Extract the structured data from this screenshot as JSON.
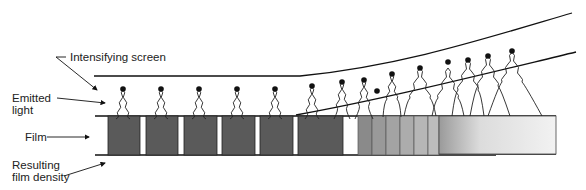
{
  "labels": {
    "intensifying_screen": "Intensifying screen",
    "emitted_light_line1": "Emitted",
    "emitted_light_line2": "light",
    "film": "Film",
    "resulting_line1": "Resulting",
    "resulting_line2": "film density"
  },
  "colors": {
    "dark_block": "#5a5a5a",
    "stroke": "#111111",
    "background": "#ffffff"
  },
  "film": {
    "dark_blocks": [
      {
        "x": 108,
        "w": 32
      },
      {
        "x": 146,
        "w": 32
      },
      {
        "x": 184,
        "w": 33
      },
      {
        "x": 222,
        "w": 33
      },
      {
        "x": 260,
        "w": 33
      },
      {
        "x": 298,
        "w": 45
      }
    ],
    "light_stripes": [
      {
        "x": 358,
        "w": 14,
        "color": "#8a8a8a"
      },
      {
        "x": 372,
        "w": 14,
        "color": "#999999"
      },
      {
        "x": 386,
        "w": 14,
        "color": "#a3a3a3"
      },
      {
        "x": 400,
        "w": 14,
        "color": "#acacac"
      },
      {
        "x": 414,
        "w": 14,
        "color": "#b6b6b6"
      },
      {
        "x": 428,
        "w": 11,
        "color": "#bdbdbd"
      }
    ]
  }
}
